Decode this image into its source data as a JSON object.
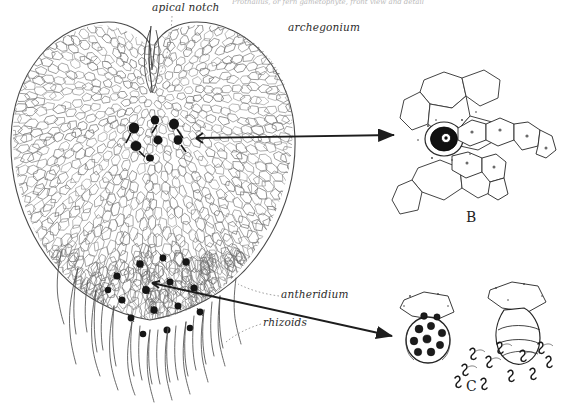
{
  "figure": {
    "kind": "botanical-line-drawing",
    "background_color": "#ffffff",
    "ink_color": "#2b2b2b",
    "width": 574,
    "height": 411
  },
  "cropped_header": {
    "text": "Prothallus, or fern gametophyte, front view and detail",
    "note": "clipped at top edge of image, illegible"
  },
  "labels": [
    {
      "id": "apical-notch",
      "text": "apical notch",
      "x": 152,
      "y": 2,
      "leader": "dotted"
    },
    {
      "id": "archegonium",
      "text": "archegonium",
      "x": 288,
      "y": 22,
      "leader": "none"
    },
    {
      "id": "antheridium",
      "text": "antheridium",
      "x": 281,
      "y": 292,
      "leader": "dotted"
    },
    {
      "id": "rhizoids",
      "text": "rhizoids",
      "x": 263,
      "y": 320,
      "leader": "dotted"
    }
  ],
  "panels": [
    {
      "id": "panel-b",
      "letter": "B",
      "x": 466,
      "y": 209,
      "caption": "archegonium with egg in venter and curved neck"
    },
    {
      "id": "panel-c",
      "letter": "C",
      "x": 466,
      "y": 378,
      "caption": "antheridium with spermatocytes and released sperm"
    }
  ],
  "arrows": [
    {
      "id": "arrow-archegonium-to-b",
      "from": [
        193,
        138
      ],
      "to": [
        398,
        135
      ],
      "style": "solid-head"
    },
    {
      "id": "arrow-antheridium-to-c",
      "from": [
        152,
        283
      ],
      "to": [
        396,
        337
      ],
      "style": "solid-head"
    }
  ],
  "structures": {
    "thallus": {
      "name": "heart-shaped thallus",
      "cell_pattern": "polygonal epidermal cells"
    },
    "archegonia_cluster": {
      "name": "archegonia",
      "count": 7,
      "location": "below apical notch"
    },
    "antheridia_cluster": {
      "name": "antheridia",
      "count": 16,
      "location": "among rhizoids, lower thallus"
    },
    "rhizoids": {
      "name": "rhizoids",
      "count": 17,
      "description": "unicellular filaments"
    }
  },
  "colors": {
    "ink": "#2b2b2b",
    "cell_line": "#555555",
    "dark_organ": "#151515",
    "background": "#ffffff"
  }
}
